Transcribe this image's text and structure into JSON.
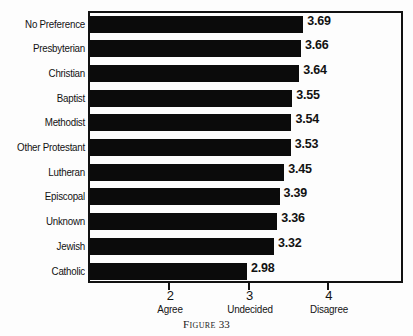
{
  "chart_data": {
    "type": "bar",
    "orientation": "horizontal",
    "title": "",
    "caption_word": "Figure",
    "caption_number": "33",
    "xlabel": "",
    "ylabel": "",
    "xlim": [
      1,
      5
    ],
    "grid": false,
    "legend": null,
    "axis_ticks": [
      {
        "value": 2,
        "number_label": "2",
        "word_label": "Agree"
      },
      {
        "value": 3,
        "number_label": "3",
        "word_label": "Undecided"
      },
      {
        "value": 4,
        "number_label": "4",
        "word_label": "Disagree"
      }
    ],
    "categories": [
      "No Preference",
      "Presbyterian",
      "Christian",
      "Baptist",
      "Methodist",
      "Other Protestant",
      "Lutheran",
      "Episcopal",
      "Unknown",
      "Jewish",
      "Catholic"
    ],
    "values": [
      3.69,
      3.66,
      3.64,
      3.55,
      3.54,
      3.53,
      3.45,
      3.39,
      3.36,
      3.32,
      2.98
    ],
    "value_labels": [
      "3.69",
      "3.66",
      "3.64",
      "3.55",
      "3.54",
      "3.53",
      "3.45",
      "3.39",
      "3.36",
      "3.32",
      "2.98"
    ],
    "colors": {
      "bar": "#0b0b0b",
      "frame": "#111111",
      "text": "#121212",
      "background": "#fdfdfd"
    }
  }
}
